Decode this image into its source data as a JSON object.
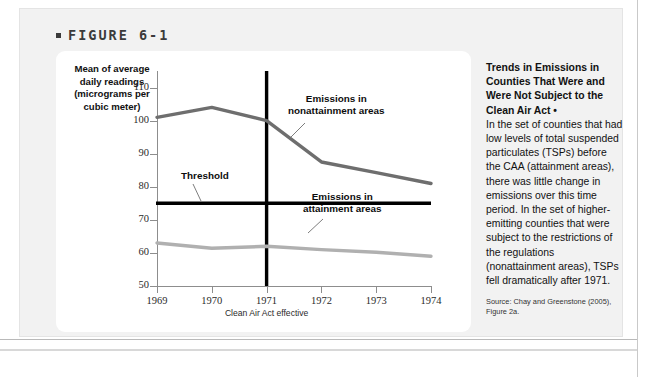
{
  "figure": {
    "label": "FIGURE 6-1"
  },
  "chart_data": {
    "type": "line",
    "title": "",
    "ylabel": "Mean of average daily readings (micrograms per cubic meter)",
    "xlabel": "",
    "ylim": [
      50,
      115
    ],
    "yticks": [
      110,
      100,
      90,
      80,
      70,
      60,
      50
    ],
    "xlim": [
      1969,
      1974
    ],
    "categories": [
      "1969",
      "1970",
      "1971",
      "1972",
      "1973",
      "1974"
    ],
    "x_sub_annotation": {
      "at": "1971",
      "text": "Clean Air Act effective"
    },
    "grid": false,
    "legend_position": "inline-annotations",
    "series": [
      {
        "name": "Emissions in nonattainment areas",
        "color": "#6e6e6e",
        "values": [
          101.0,
          104.0,
          100.0,
          87.5,
          84.3,
          81.0
        ]
      },
      {
        "name": "Emissions in attainment areas",
        "color": "#b0b0b0",
        "values": [
          63.0,
          61.4,
          62.0,
          61.0,
          60.2,
          59.0
        ]
      }
    ],
    "reference_lines": [
      {
        "name": "Threshold",
        "orientation": "horizontal",
        "value": 75,
        "color": "#000000",
        "label": "Threshold"
      },
      {
        "name": "Clean Air Act effective",
        "orientation": "vertical",
        "value": 1971,
        "color": "#000000",
        "label": ""
      }
    ],
    "annotations": [
      {
        "name": "threshold",
        "text": "Threshold"
      },
      {
        "name": "nonattainment",
        "text": "Emissions in nonattainment areas"
      },
      {
        "name": "attainment",
        "text": "Emissions in attainment areas"
      }
    ]
  },
  "sidebar": {
    "title": "Trends in Emissions in Counties That Were and Were Not Subject to the Clean Air Act •",
    "body": "In the set of counties that had low levels of total suspended particulates (TSPs) before the CAA (attainment areas), there was little change in emissions over this time period. In the set of higher-emitting counties that were subject to the restrictions of the regulations (nonattainment areas), TSPs fell dramatically after 1971.",
    "source": "Source: Chay and Greenstone (2005), Figure 2a."
  }
}
